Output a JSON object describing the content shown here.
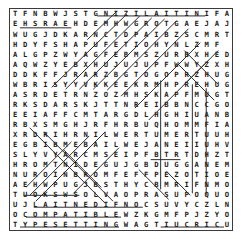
{
  "puzzle": {
    "title": "word-search-grid",
    "rows": 18,
    "cols": 22,
    "ink_color": "#1c1c1c",
    "border_color": "#3a3a3a",
    "strike_color": "#2b2b2b",
    "background_color": "#ffffff",
    "grid": [
      "TFNBWJSTGNIZILAITINIFA",
      "EHSRAEHDEMHWGROTGAEJAJ",
      "WUGJDKARNCTDPAIBZSCMRT",
      "HDYFSHAPUFETIOHYNLZMF",
      "ALGPZWYAGFEBMSZURBXHED",
      "AQWZYEBXHUJUJUPFWWYZXH",
      "DDKFFJRARZBGTOGOPRZHUG",
      "WBRISYYVKKEEKRMHPREHUG",
      "ASRDETRNZOZMHSKAPFMUGT",
      "RKSDARSKJTTNREIBBNCCGO",
      "EEIAFFCMTARGDLHGHIUANB",
      "RBXSMGHJRFHRBUQHOMMFIA",
      "XRDRIHRNILWERTUMERTUUH",
      "EGBIBMEBAILWEJANEIIUHV",
      "SLYVYARCMSEIPFBTRTDHZT",
      "HROMTNIDEGUJGBDUGGANEM",
      "NUROINBROMFEFFPEZOTIOE",
      "AEHWPUGJBSTHYCBMRIFNMO"
    ],
    "bottom_rows": [
      "TUOKSWSOLVAOPRASUPOQUO",
      "UJLAITNEDIFNOCSUVYCZLN",
      "OCOMPATIBLEWZKGMFPJZYO",
      "TYPESETTINGWAGTIUCRICU"
    ],
    "found_words": [
      "INITIALIZING",
      "HEARSH",
      "CONFIDENTIAL",
      "COMPATIBLE",
      "TYPESETTING",
      "CIRCUIT"
    ],
    "strikes": [
      {
        "name": "strike-initializing",
        "type": "horizontal",
        "x1": 88,
        "y1": 7,
        "x2": 197,
        "y2": 7
      },
      {
        "name": "strike-hearsh",
        "type": "horizontal",
        "x1": 10,
        "y1": 19,
        "x2": 62,
        "y2": 19
      },
      {
        "name": "strike-diag-a",
        "type": "diagonal",
        "x1": 78,
        "y1": 31,
        "x2": 108,
        "y2": 2
      },
      {
        "name": "strike-diag-b",
        "type": "diagonal",
        "x1": 42,
        "y1": 79,
        "x2": 118,
        "y2": 5
      },
      {
        "name": "strike-diag-c",
        "type": "diagonal",
        "x1": 56,
        "y1": 81,
        "x2": 131,
        "y2": 7
      },
      {
        "name": "strike-diag-d",
        "type": "diagonal",
        "x1": 70,
        "y1": 81,
        "x2": 143,
        "y2": 9
      },
      {
        "name": "strike-diag-e",
        "type": "diagonal",
        "x1": 84,
        "y1": 81,
        "x2": 156,
        "y2": 10
      },
      {
        "name": "strike-diag-f",
        "type": "diagonal",
        "x1": 98,
        "y1": 82,
        "x2": 168,
        "y2": 12
      },
      {
        "name": "strike-diag-g",
        "type": "diagonal",
        "x1": 112,
        "y1": 88,
        "x2": 180,
        "y2": 20
      },
      {
        "name": "strike-diag-h",
        "type": "diagonal",
        "x1": 126,
        "y1": 100,
        "x2": 192,
        "y2": 34
      },
      {
        "name": "strike-diag-i",
        "type": "diagonal",
        "x1": 140,
        "y1": 112,
        "x2": 200,
        "y2": 52
      },
      {
        "name": "strike-diag-x1",
        "type": "diagonal",
        "x1": 176,
        "y1": 42,
        "x2": 210,
        "y2": 76
      },
      {
        "name": "strike-diag-x2",
        "type": "diagonal",
        "x1": 210,
        "y1": 42,
        "x2": 176,
        "y2": 76
      },
      {
        "name": "strike-diag-x3",
        "type": "diagonal",
        "x1": 170,
        "y1": 56,
        "x2": 206,
        "y2": 92
      },
      {
        "name": "strike-vert-a",
        "type": "vertical",
        "x1": 152,
        "y1": 72,
        "x2": 152,
        "y2": 182
      },
      {
        "name": "strike-vert-b",
        "type": "vertical",
        "x1": 184,
        "y1": 76,
        "x2": 184,
        "y2": 186
      },
      {
        "name": "strike-vert-c",
        "type": "vertical",
        "x1": 198,
        "y1": 80,
        "x2": 198,
        "y2": 188
      },
      {
        "name": "strike-diag-j",
        "type": "diagonal",
        "x1": 20,
        "y1": 120,
        "x2": 96,
        "y2": 196
      },
      {
        "name": "strike-diag-k",
        "type": "diagonal",
        "x1": 34,
        "y1": 124,
        "x2": 104,
        "y2": 194
      },
      {
        "name": "strike-diag-l",
        "type": "diagonal",
        "x1": 96,
        "y1": 124,
        "x2": 26,
        "y2": 194
      },
      {
        "name": "strike-diag-m",
        "type": "diagonal",
        "x1": 80,
        "y1": 128,
        "x2": 20,
        "y2": 188
      },
      {
        "name": "strike-diag-n",
        "type": "diagonal",
        "x1": 62,
        "y1": 134,
        "x2": 16,
        "y2": 180
      },
      {
        "name": "strike-diag-o",
        "type": "diagonal",
        "x1": 110,
        "y1": 140,
        "x2": 64,
        "y2": 186
      },
      {
        "name": "strike-diag-p",
        "type": "diagonal",
        "x1": 54,
        "y1": 142,
        "x2": 92,
        "y2": 180
      },
      {
        "name": "strike-diag-q",
        "type": "diagonal",
        "x1": 130,
        "y1": 162,
        "x2": 160,
        "y2": 192
      },
      {
        "name": "strike-diag-r",
        "type": "diagonal",
        "x1": 158,
        "y1": 164,
        "x2": 182,
        "y2": 188
      },
      {
        "name": "strike-horiz-sei",
        "type": "horizontal",
        "x1": 142,
        "y1": 152,
        "x2": 172,
        "y2": 152
      },
      {
        "name": "strike-horiz-neuqes",
        "type": "horizontal",
        "x1": 14,
        "y1": 188,
        "x2": 70,
        "y2": 188
      },
      {
        "name": "strike-confidential",
        "type": "horizontal",
        "x1": 24,
        "y1": 200,
        "x2": 134,
        "y2": 200
      },
      {
        "name": "strike-compatible",
        "type": "horizontal",
        "x1": 16,
        "y1": 210,
        "x2": 112,
        "y2": 210
      },
      {
        "name": "strike-typesetting",
        "type": "horizontal",
        "x1": 10,
        "y1": 220,
        "x2": 110,
        "y2": 220
      },
      {
        "name": "strike-circuit",
        "type": "horizontal",
        "x1": 152,
        "y1": 220,
        "x2": 216,
        "y2": 220
      }
    ]
  }
}
